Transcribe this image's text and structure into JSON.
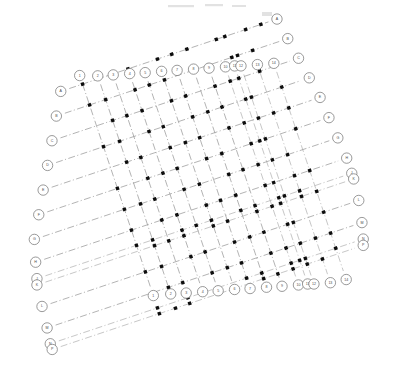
{
  "drawing": {
    "title": "Column Grid Plan",
    "type": "structural-column-grid",
    "background_color": "#ffffff",
    "line_color": "#9a9a9a",
    "marker_color": "#0d0d0d",
    "bubble_stroke_color": "#6f6f6f",
    "bubble_text_color": "#4a4a4a",
    "rotation_degrees": -18.5,
    "line_style": "dash-dot centerline",
    "bubble_radius": 5.2,
    "marker_size": 3.4
  },
  "chart_data": {
    "type": "scatter",
    "xlabel": "",
    "ylabel": "",
    "grid": true,
    "legend": "none",
    "rotation_degrees": -18.5,
    "origin": {
      "x": 120,
      "y": 196
    },
    "axis_a_label": "column-lines",
    "axis_b_label": "row-lines",
    "column_lines": [
      {
        "label": "1",
        "offset": 0,
        "start": -118,
        "end": 96
      },
      {
        "label": "2",
        "offset": 17,
        "start": -112,
        "end": 100
      },
      {
        "label": "3",
        "offset": 32,
        "start": -108,
        "end": 104
      },
      {
        "label": "4",
        "offset": 48,
        "start": -104,
        "end": 108
      },
      {
        "label": "5",
        "offset": 63,
        "start": -100,
        "end": 112
      },
      {
        "label": "6",
        "offset": 79,
        "start": -96,
        "end": 116
      },
      {
        "label": "7",
        "offset": 94,
        "start": -92,
        "end": 120
      },
      {
        "label": "8",
        "offset": 110,
        "start": -88,
        "end": 124
      },
      {
        "label": "9",
        "offset": 125,
        "start": -84,
        "end": 128
      },
      {
        "label": "10",
        "offset": 141,
        "start": -80,
        "end": 132
      },
      {
        "label": "11",
        "offset": 150,
        "start": -78,
        "end": 134
      },
      {
        "label": "12",
        "offset": 156,
        "start": -76,
        "end": 136
      },
      {
        "label": "13",
        "offset": 172,
        "start": -72,
        "end": 140
      },
      {
        "label": "14",
        "offset": 188,
        "start": -68,
        "end": 142
      }
    ],
    "row_lines": [
      {
        "label": "A",
        "offset": -118,
        "start": -14,
        "end": 196
      },
      {
        "label": "B",
        "offset": -96,
        "start": -26,
        "end": 200
      },
      {
        "label": "C",
        "offset": -74,
        "start": -38,
        "end": 204
      },
      {
        "label": "D",
        "offset": -52,
        "start": -50,
        "end": 208
      },
      {
        "label": "E",
        "offset": -30,
        "start": -62,
        "end": 212
      },
      {
        "label": "F",
        "offset": -8,
        "start": -74,
        "end": 214
      },
      {
        "label": "G",
        "offset": 14,
        "start": -86,
        "end": 216
      },
      {
        "label": "H",
        "offset": 36,
        "start": -92,
        "end": 218
      },
      {
        "label": "J",
        "offset": 52,
        "start": -96,
        "end": 218
      },
      {
        "label": "K",
        "offset": 58,
        "start": -98,
        "end": 218
      },
      {
        "label": "L",
        "offset": 80,
        "start": -100,
        "end": 216
      },
      {
        "label": "M",
        "offset": 102,
        "start": -102,
        "end": 212
      },
      {
        "label": "N",
        "offset": 118,
        "start": -104,
        "end": 208
      },
      {
        "label": "P",
        "offset": 124,
        "start": -104,
        "end": 206
      }
    ],
    "bubble_clusters": [
      {
        "at": "column",
        "label": "11",
        "extra": [
          "10",
          "9",
          "8"
        ]
      },
      {
        "at": "column",
        "label": "12",
        "extra": [
          "13"
        ]
      },
      {
        "at": "row",
        "label": "J",
        "extra": [
          "K"
        ]
      },
      {
        "at": "row",
        "label": "N",
        "extra": [
          "P",
          "M",
          "L"
        ]
      }
    ]
  }
}
